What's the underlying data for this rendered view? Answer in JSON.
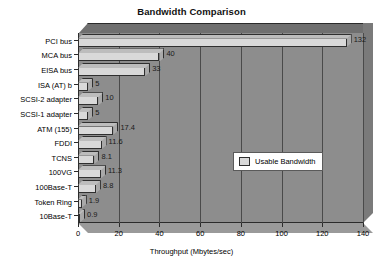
{
  "chart_data": {
    "type": "bar",
    "orientation": "horizontal",
    "title": "Bandwidth Comparison",
    "xlabel": "Throughput (Mbytes/sec)",
    "ylabel": "",
    "xlim": [
      0,
      140
    ],
    "xticks": [
      0,
      20,
      40,
      60,
      80,
      100,
      120,
      140
    ],
    "grid": true,
    "legend_position": "center-right",
    "categories": [
      "PCI bus",
      "MCA bus",
      "EISA bus",
      "ISA (AT) b",
      "SCSI-2 adapter",
      "SCSI-1 adapter",
      "ATM (155)",
      "FDDI",
      "TCNS",
      "100VG",
      "100Base-T",
      "Token Ring",
      "10Base-T"
    ],
    "series": [
      {
        "name": "Usable Bandwidth",
        "values": [
          132,
          40,
          33,
          5,
          10,
          5,
          17.4,
          11.6,
          8.1,
          11.3,
          8.8,
          1.9,
          0.9
        ]
      }
    ],
    "value_labels": [
      "132",
      "40",
      "33",
      "5",
      "10",
      "5",
      "17.4",
      "11.6",
      "8.1",
      "11.3",
      "8.8",
      "1.9",
      "0.9"
    ],
    "colors": {
      "bar_face": "#d9d9d9",
      "bar_top": "#bdbdbd",
      "bar_side": "#a9a9a9",
      "plot_background": "#8d8d8d",
      "gridline": "#4a4a4a",
      "axis": "#2b2b2b",
      "text": "#000000",
      "legend_background": "#ffffff"
    }
  },
  "legend": {
    "entry_label": "Usable Bandwidth"
  }
}
